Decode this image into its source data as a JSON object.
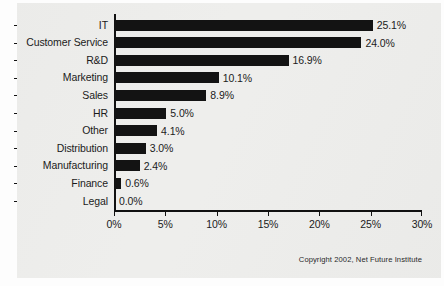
{
  "panel": {
    "background_color": "#eeeeec",
    "page_background_color": "#fdfdfd"
  },
  "credit": "Copyright 2002, Net Future Institute",
  "chart_data": {
    "type": "bar",
    "orientation": "horizontal",
    "title": "",
    "xlabel": "",
    "ylabel": "",
    "xlim": [
      0,
      30
    ],
    "grid": false,
    "legend": false,
    "bar_color": "#131313",
    "axis_color": "#111111",
    "value_label_suffix": "%",
    "categories": [
      "IT",
      "Customer Service",
      "R&D",
      "Marketing",
      "Sales",
      "HR",
      "Other",
      "Distribution",
      "Manufacturing",
      "Finance",
      "Legal"
    ],
    "values": [
      25.1,
      24.0,
      16.9,
      10.1,
      8.9,
      5.0,
      4.1,
      3.0,
      2.4,
      0.6,
      0.0
    ],
    "value_labels": [
      "25.1%",
      "24.0%",
      "16.9%",
      "10.1%",
      "8.9%",
      "5.0%",
      "4.1%",
      "3.0%",
      "2.4%",
      "0.6%",
      "0.0%"
    ],
    "xticks": [
      0,
      5,
      10,
      15,
      20,
      25,
      30
    ],
    "xtick_labels": [
      "0%",
      "5%",
      "10%",
      "15%",
      "20%",
      "25%",
      "30%"
    ]
  }
}
